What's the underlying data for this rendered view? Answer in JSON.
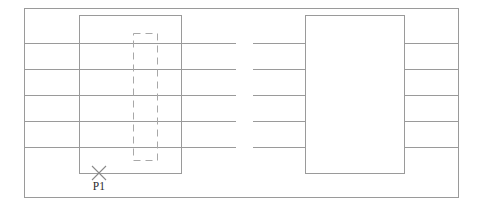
{
  "canvas": {
    "width": 483,
    "height": 212,
    "background": "#ffffff"
  },
  "style": {
    "frame_color": "#9a9a9a",
    "rect_color": "#9a9a9a",
    "dashed_color": "#a8a8a8",
    "line_color": "#9a9a9a",
    "marker_color": "#8a8a8a",
    "text_color": "#2b2b2b",
    "stroke_width": 1,
    "dash_pattern": "7 5"
  },
  "frame": {
    "name": "outer-border",
    "x": 24,
    "y": 8,
    "width": 434,
    "height": 189
  },
  "rectangles": [
    {
      "name": "left-solid-rectangle",
      "style": "solid",
      "x": 79,
      "y": 15,
      "width": 102,
      "height": 158
    },
    {
      "name": "inner-dashed-rectangle",
      "style": "dashed",
      "x": 133,
      "y": 33,
      "width": 24,
      "height": 127
    },
    {
      "name": "right-solid-rectangle",
      "style": "solid",
      "x": 305,
      "y": 15,
      "width": 99,
      "height": 158
    }
  ],
  "horizontal_lines": {
    "count": 5,
    "y_positions": [
      43,
      69,
      95,
      121,
      147
    ],
    "segments": [
      {
        "name": "left-segment",
        "x1": 24,
        "x2": 236
      },
      {
        "name": "middle-segment",
        "x1": 253,
        "x2": 305
      },
      {
        "name": "right-segment",
        "x1": 404,
        "x2": 458
      }
    ]
  },
  "markers": [
    {
      "name": "point-marker-p1",
      "shape": "cross",
      "cx": 99,
      "cy": 173,
      "arm": 7,
      "label": "P1",
      "label_x": 99,
      "label_y": 190
    }
  ]
}
